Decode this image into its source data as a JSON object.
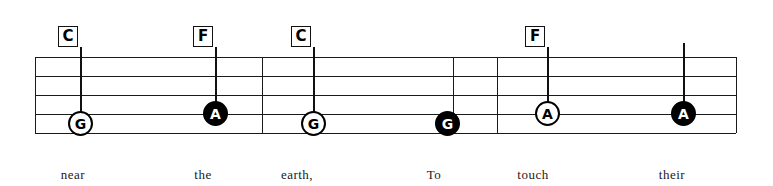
{
  "sheet": {
    "title": "Lead sheet staff excerpt",
    "background_color": "#ffffff",
    "ink_color": "#1a1a1a",
    "note_fill_color": "#000000",
    "note_hollow_color": "#ffffff"
  },
  "staff": {
    "left": 35,
    "right": 736,
    "line_count": 5,
    "line_y": [
      57,
      76,
      95,
      114,
      133
    ],
    "barline_x": [
      262,
      453,
      497
    ]
  },
  "chords": [
    {
      "label": "C",
      "x": 68,
      "y": 26
    },
    {
      "label": "F",
      "x": 203,
      "y": 26
    },
    {
      "label": "C",
      "x": 301,
      "y": 26
    },
    {
      "label": "F",
      "x": 535,
      "y": 26
    }
  ],
  "notes": [
    {
      "letter": "G",
      "style": "hollow",
      "x": 70,
      "y": 123,
      "staff_position": "line-4",
      "has_stem": true,
      "stem_top": 47
    },
    {
      "letter": "A",
      "style": "filled",
      "x": 205,
      "y": 113,
      "staff_position": "space-3",
      "has_stem": true,
      "stem_top": 47
    },
    {
      "letter": "G",
      "style": "hollow",
      "x": 303,
      "y": 123,
      "staff_position": "line-4",
      "has_stem": true,
      "stem_top": 47
    },
    {
      "letter": "G",
      "style": "filled",
      "x": 437,
      "y": 123,
      "staff_position": "line-4",
      "has_stem": false,
      "stem_top": 0
    },
    {
      "letter": "A",
      "style": "hollow",
      "x": 537,
      "y": 113,
      "staff_position": "space-3",
      "has_stem": true,
      "stem_top": 47
    },
    {
      "letter": "A",
      "style": "filled",
      "x": 673,
      "y": 113,
      "staff_position": "space-3",
      "has_stem": true,
      "stem_top": 43
    }
  ],
  "lyrics": [
    {
      "text": "near",
      "x": 73
    },
    {
      "text": "the",
      "x": 203
    },
    {
      "text": "earth,",
      "x": 297
    },
    {
      "text": "To",
      "x": 434
    },
    {
      "text": "touch",
      "x": 533
    },
    {
      "text": "their",
      "x": 672
    }
  ],
  "lyrics_baseline_y": 167
}
